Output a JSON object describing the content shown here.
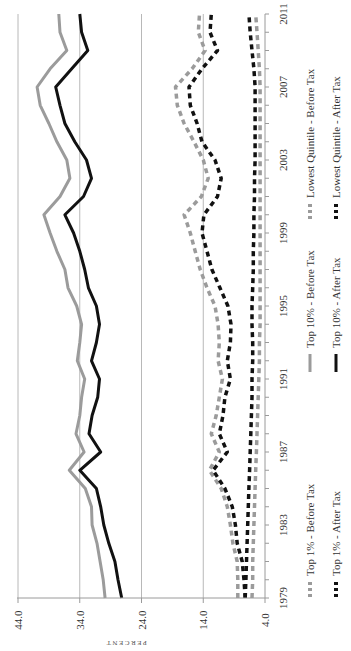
{
  "chart_data": {
    "type": "line",
    "orientation": "rotated 90 degrees counter-clockwise (years run bottom-to-top, percent runs left-to-right decreasing)",
    "title": "",
    "xlabel": "",
    "ylabel": "PERCENT",
    "ylim": [
      4.0,
      44.0
    ],
    "yticks": [
      "44.0",
      "34.0",
      "24.0",
      "14.0",
      "4.0"
    ],
    "xticks": [
      "1979",
      "1983",
      "1987",
      "1991",
      "1995",
      "1999",
      "2003",
      "2007",
      "2011"
    ],
    "grid": true,
    "legend_position": "bottom",
    "x": [
      1979,
      1980,
      1981,
      1982,
      1983,
      1984,
      1985,
      1986,
      1987,
      1988,
      1989,
      1990,
      1991,
      1992,
      1993,
      1994,
      1995,
      1996,
      1997,
      1998,
      1999,
      2000,
      2001,
      2002,
      2003,
      2004,
      2005,
      2006,
      2007,
      2008,
      2009,
      2010,
      2011
    ],
    "series": [
      {
        "name": "Top 1% - Before Tax",
        "style": "dashed",
        "color": "#9b9b9b",
        "values": [
          8.4,
          8.4,
          8.5,
          9.2,
          9.6,
          10.1,
          11.1,
          13.0,
          11.4,
          12.7,
          11.9,
          11.4,
          10.9,
          11.6,
          11.4,
          11.6,
          12.1,
          13.4,
          14.5,
          15.3,
          16.1,
          17.1,
          14.3,
          13.2,
          14.0,
          15.5,
          17.1,
          18.2,
          18.5,
          15.8,
          13.7,
          14.8,
          14.6
        ]
      },
      {
        "name": "Top 1% - After Tax",
        "style": "dashed",
        "color": "#111111",
        "values": [
          7.2,
          7.4,
          7.7,
          8.5,
          8.8,
          9.3,
          10.5,
          12.4,
          10.1,
          11.4,
          10.8,
          10.5,
          9.6,
          10.1,
          9.6,
          9.5,
          10.0,
          11.3,
          12.6,
          13.4,
          14.2,
          13.9,
          11.7,
          11.1,
          12.1,
          14.2,
          15.0,
          16.1,
          16.3,
          14.2,
          11.7,
          12.9,
          12.7
        ]
      },
      {
        "name": "Top 10% - Before Tax",
        "style": "solid",
        "color": "#9b9b9b",
        "values": [
          29.9,
          30.2,
          30.7,
          31.2,
          32.0,
          32.1,
          33.1,
          35.7,
          33.3,
          34.6,
          34.0,
          33.7,
          33.2,
          34.4,
          34.0,
          33.7,
          34.5,
          35.9,
          36.4,
          37.7,
          38.8,
          39.8,
          37.2,
          35.6,
          36.1,
          37.7,
          39.0,
          40.4,
          40.9,
          38.8,
          36.1,
          37.2,
          37.4
        ]
      },
      {
        "name": "Top 10% - After Tax",
        "style": "solid",
        "color": "#111111",
        "values": [
          27.2,
          27.8,
          28.3,
          29.3,
          30.1,
          30.6,
          31.3,
          34.0,
          30.6,
          32.5,
          32.0,
          31.1,
          30.8,
          32.1,
          31.3,
          30.8,
          31.3,
          32.6,
          33.2,
          34.0,
          35.0,
          36.4,
          33.4,
          32.1,
          32.9,
          34.8,
          36.4,
          37.2,
          37.9,
          35.3,
          32.7,
          33.7,
          34.0
        ]
      },
      {
        "name": "Lowest Quintile - Before Tax",
        "style": "dashed",
        "color": "#9b9b9b",
        "values": [
          6.1,
          6.0,
          6.0,
          5.9,
          5.8,
          5.7,
          5.6,
          5.5,
          5.4,
          5.3,
          5.2,
          5.1,
          5.0,
          4.9,
          4.9,
          4.8,
          4.8,
          4.8,
          4.8,
          4.8,
          4.8,
          4.8,
          4.8,
          4.8,
          4.8,
          4.8,
          4.8,
          4.8,
          4.8,
          4.9,
          5.1,
          5.3,
          5.5
        ]
      },
      {
        "name": "Lowest Quintile - After Tax",
        "style": "dashed",
        "color": "#111111",
        "values": [
          7.2,
          7.1,
          7.0,
          6.9,
          6.8,
          6.7,
          6.6,
          6.5,
          6.4,
          6.3,
          6.2,
          6.1,
          6.1,
          6.0,
          6.0,
          6.1,
          6.1,
          6.0,
          5.9,
          5.9,
          5.8,
          5.8,
          5.7,
          5.7,
          5.6,
          5.6,
          5.6,
          5.6,
          5.6,
          5.8,
          6.1,
          6.4,
          6.6
        ]
      }
    ]
  },
  "legend": {
    "items": [
      {
        "label": "Top 1% - Before Tax"
      },
      {
        "label": "Top 1% - After Tax"
      },
      {
        "label": "Top 10% - Before Tax"
      },
      {
        "label": "Top 10% - After Tax"
      },
      {
        "label": "Lowest Quintile - Before Tax"
      },
      {
        "label": "Lowest Quintile - After Tax"
      }
    ]
  },
  "axis": {
    "y_label": "PERCENT",
    "y_ticks": [
      "44.0",
      "34.0",
      "24.0",
      "14.0",
      "4.0"
    ],
    "x_ticks": [
      "1979",
      "1983",
      "1987",
      "1991",
      "1995",
      "1999",
      "2003",
      "2007",
      "2011"
    ]
  }
}
